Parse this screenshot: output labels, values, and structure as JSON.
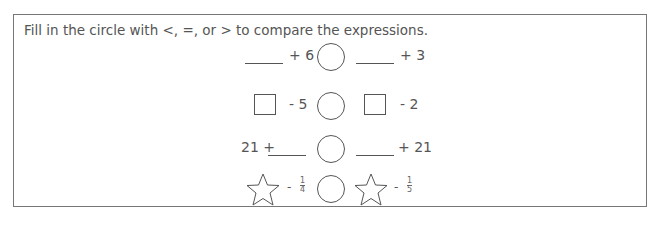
{
  "instruction": "Fill in the circle with <, =, or > to compare the expressions.",
  "rows": [
    {
      "left": {
        "blank_prefix": "",
        "shape": "blank",
        "text": "+ 6"
      },
      "right": {
        "shape": "blank",
        "text": "+ 3"
      }
    },
    {
      "left": {
        "shape": "square",
        "text": "- 5"
      },
      "right": {
        "shape": "square",
        "text": "- 2"
      }
    },
    {
      "left": {
        "prefix": "21 +",
        "shape": "blank",
        "text": ""
      },
      "right": {
        "shape": "blank",
        "text": "+ 21"
      }
    },
    {
      "left": {
        "shape": "star",
        "op": "-",
        "frac_num": "1",
        "frac_den": "4"
      },
      "right": {
        "shape": "star",
        "op": "-",
        "frac_num": "1",
        "frac_den": "5"
      }
    }
  ]
}
